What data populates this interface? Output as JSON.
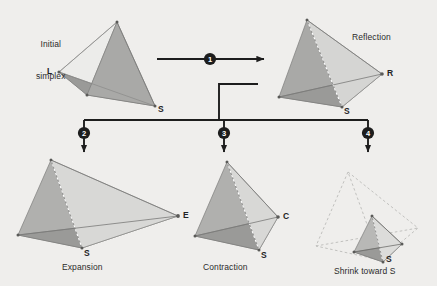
{
  "diagram": {
    "background_color": "#efeeec",
    "line_color": "#1a1a1a",
    "panels": [
      {
        "id": "initial",
        "caption": "Initial\nsimplex",
        "caption_line1": "Initial",
        "caption_line2": "simplex",
        "vertex_labels": [
          "L",
          "S"
        ]
      },
      {
        "id": "reflection",
        "caption": "Reflection",
        "vertex_labels": [
          "R",
          "S"
        ]
      },
      {
        "id": "expansion",
        "caption": "Expansion",
        "vertex_labels": [
          "E",
          "S"
        ]
      },
      {
        "id": "contraction",
        "caption": "Contraction",
        "vertex_labels": [
          "C",
          "S"
        ]
      },
      {
        "id": "shrink",
        "caption": "Shrink toward S",
        "vertex_labels": [
          "S"
        ]
      }
    ],
    "steps": [
      {
        "number": "1",
        "label": "reflect"
      },
      {
        "number": "2",
        "label": "expand"
      },
      {
        "number": "3",
        "label": "contract"
      },
      {
        "number": "4",
        "label": "shrink"
      }
    ],
    "labels": {
      "initial_l1": "Initial",
      "initial_l2": "simplex",
      "initial_L": "L",
      "initial_S": "S",
      "reflection_caption": "Reflection",
      "reflection_R": "R",
      "reflection_S": "S",
      "expansion_caption": "Expansion",
      "expansion_E": "E",
      "expansion_S": "S",
      "contraction_caption": "Contraction",
      "contraction_C": "C",
      "contraction_S": "S",
      "shrink_caption": "Shrink toward S",
      "shrink_S": "S",
      "step1": "1",
      "step2": "2",
      "step3": "3",
      "step4": "4"
    },
    "colors": {
      "face_light": "#ececea",
      "face_mid": "#c9c9c7",
      "face_dark": "#9d9d9b",
      "face_bottom": "#8e8e8c",
      "edge": "#6e6e6c",
      "dashed": "#b9b9b7",
      "arrow": "#1d1d1d",
      "marker_fill": "#1d1d1d",
      "marker_text": "#ffffff",
      "text": "#2b2b2b"
    }
  }
}
